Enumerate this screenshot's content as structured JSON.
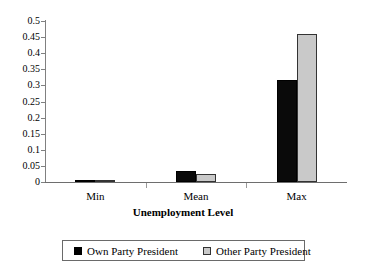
{
  "chart_data": {
    "type": "bar",
    "title": "",
    "xlabel": "Unemployment Level",
    "ylabel": "",
    "categories": [
      "Min",
      "Mean",
      "Max"
    ],
    "series": [
      {
        "name": "Own Party President",
        "color": "#000000",
        "values": [
          0.001,
          0.034,
          0.318
        ]
      },
      {
        "name": "Other Party President",
        "color": "#c9c9c9",
        "values": [
          0.001,
          0.025,
          0.461
        ]
      }
    ],
    "ylim": [
      0,
      0.5
    ],
    "ytick_labels": [
      "0",
      "0.05",
      "0.1",
      "0.15",
      "0.2",
      "0.25",
      "0.3",
      "0.35",
      "0.4",
      "0.45",
      "0.5"
    ],
    "ytick_values": [
      0,
      0.05,
      0.1,
      0.15,
      0.2,
      0.25,
      0.3,
      0.35,
      0.4,
      0.45,
      0.5
    ],
    "grid": false,
    "legend_position": "bottom"
  }
}
